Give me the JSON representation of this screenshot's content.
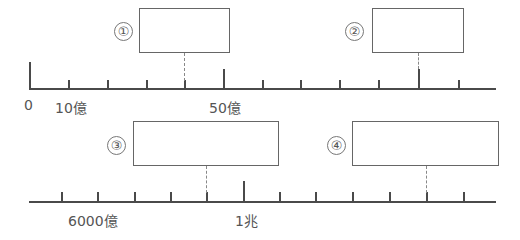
{
  "diagram": {
    "top_line": {
      "labels": {
        "zero": "0",
        "ten_oku": "10億",
        "fifty_oku": "50億"
      },
      "markers": [
        {
          "id": "1",
          "symbol": "①"
        },
        {
          "id": "2",
          "symbol": "②"
        }
      ]
    },
    "bottom_line": {
      "labels": {
        "six_thousand_oku": "6000億",
        "one_cho": "1兆"
      },
      "markers": [
        {
          "id": "3",
          "symbol": "③"
        },
        {
          "id": "4",
          "symbol": "④"
        }
      ]
    }
  }
}
